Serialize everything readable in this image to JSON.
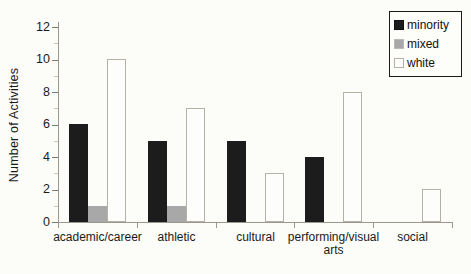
{
  "chart_data": {
    "type": "bar",
    "title": "",
    "xlabel": "",
    "ylabel": "Number of Activities",
    "categories": [
      "academic/career",
      "athletic",
      "cultural",
      "performing/visual arts",
      "social"
    ],
    "series": [
      {
        "name": "minority",
        "color": "#1c1c1c",
        "values": [
          6,
          5,
          5,
          4,
          0
        ]
      },
      {
        "name": "mixed",
        "color": "#a8a8a8",
        "values": [
          1,
          1,
          0,
          0,
          0
        ]
      },
      {
        "name": "white",
        "color": "#fdfdfb",
        "values": [
          10,
          7,
          3,
          8,
          2
        ]
      }
    ],
    "ylim": [
      0,
      12
    ],
    "yticks": [
      0,
      2,
      4,
      6,
      8,
      10,
      12
    ],
    "grid": false,
    "legend_position": "top-right",
    "colors": {
      "axis": "#9b978c",
      "white_bar_border": "#b5b1a6",
      "text": "#1a1a1a",
      "background": "#fcfcf9"
    }
  },
  "legend": {
    "entries": [
      "minority",
      "mixed",
      "white"
    ]
  }
}
